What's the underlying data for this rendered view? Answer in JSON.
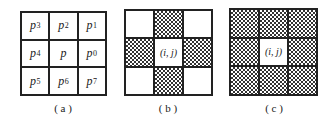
{
  "figure": {
    "panels": [
      {
        "id": "a",
        "caption": "( a )",
        "cells": [
          {
            "base": "p",
            "sub": "3"
          },
          {
            "base": "p",
            "sub": "2"
          },
          {
            "base": "p",
            "sub": "1"
          },
          {
            "base": "p",
            "sub": "4"
          },
          {
            "base": "p",
            "sub": ""
          },
          {
            "base": "p",
            "sub": "0"
          },
          {
            "base": "p",
            "sub": "5"
          },
          {
            "base": "p",
            "sub": "6"
          },
          {
            "base": "p",
            "sub": "7"
          }
        ]
      },
      {
        "id": "b",
        "caption": "( b )",
        "center_label": "(i, j)",
        "hatched": [
          false,
          true,
          false,
          true,
          false,
          true,
          false,
          true,
          false
        ],
        "description": "4-neighborhood"
      },
      {
        "id": "c",
        "caption": "( c )",
        "center_label": "(i, j)",
        "hatched": [
          true,
          true,
          true,
          true,
          false,
          true,
          true,
          true,
          true
        ],
        "description": "8-neighborhood"
      }
    ],
    "colors": {
      "line": "#222222",
      "hatch": "#333333",
      "background": "#ffffff"
    }
  }
}
